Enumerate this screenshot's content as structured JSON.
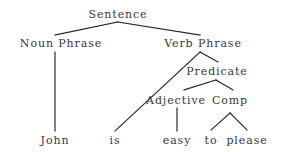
{
  "diagram": {
    "type": "syntax-parse-tree",
    "sentence": "John is easy to please",
    "colors": {
      "background": "#ffffff",
      "text": "#37373a",
      "line": "#2b2b2e"
    },
    "nodes": [
      {
        "id": "sentence",
        "label": "Sentence",
        "x": 118,
        "y": 9,
        "kind": "phrase"
      },
      {
        "id": "noun-phrase",
        "label": "Noun Phrase",
        "x": 61,
        "y": 38,
        "kind": "phrase"
      },
      {
        "id": "verb-phrase",
        "label": "Verb Phrase",
        "x": 203,
        "y": 38,
        "kind": "phrase"
      },
      {
        "id": "predicate",
        "label": "Predicate",
        "x": 217,
        "y": 66,
        "kind": "phrase"
      },
      {
        "id": "adjective",
        "label": "Adjective",
        "x": 176,
        "y": 95,
        "kind": "phrase"
      },
      {
        "id": "comp",
        "label": "Comp",
        "x": 230,
        "y": 95,
        "kind": "phrase"
      }
    ],
    "leaves": [
      {
        "id": "john",
        "label": "John",
        "x": 55,
        "y": 135
      },
      {
        "id": "is",
        "label": "is",
        "x": 115,
        "y": 135
      },
      {
        "id": "easy",
        "label": "easy",
        "x": 177,
        "y": 135
      },
      {
        "id": "to",
        "label": "to",
        "x": 211,
        "y": 135
      },
      {
        "id": "please",
        "label": "please",
        "x": 247,
        "y": 135
      }
    ],
    "edges": [
      {
        "id": "sentence-to-noun-phrase",
        "x1": 118,
        "y1": 22,
        "x2": 55,
        "y2": 35
      },
      {
        "id": "sentence-to-verb-phrase",
        "x1": 118,
        "y1": 22,
        "x2": 200,
        "y2": 35
      },
      {
        "id": "noun-phrase-to-john",
        "x1": 55,
        "y1": 52,
        "x2": 55,
        "y2": 131
      },
      {
        "id": "verb-phrase-to-is",
        "x1": 200,
        "y1": 52,
        "x2": 115,
        "y2": 131
      },
      {
        "id": "verb-phrase-to-predicate",
        "x1": 200,
        "y1": 52,
        "x2": 218,
        "y2": 62
      },
      {
        "id": "predicate-to-adjective",
        "x1": 216,
        "y1": 80,
        "x2": 184,
        "y2": 90
      },
      {
        "id": "predicate-to-comp",
        "x1": 216,
        "y1": 80,
        "x2": 233,
        "y2": 90
      },
      {
        "id": "adjective-to-easy",
        "x1": 177,
        "y1": 108,
        "x2": 177,
        "y2": 131
      },
      {
        "id": "comp-to-to",
        "x1": 230,
        "y1": 113,
        "x2": 211,
        "y2": 130
      },
      {
        "id": "comp-to-please",
        "x1": 230,
        "y1": 113,
        "x2": 247,
        "y2": 130
      }
    ]
  }
}
